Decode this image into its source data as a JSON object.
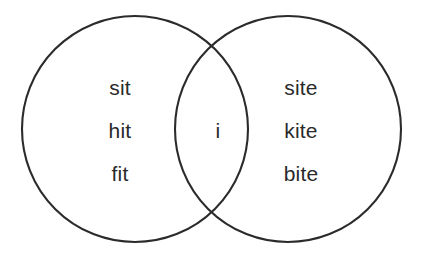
{
  "diagram": {
    "type": "venn-2-set",
    "title": "",
    "background_color": "#ffffff",
    "stroke_color": "#2b2b2b",
    "text_color": "#2a2a2a",
    "left_circle": {
      "center_x": 135,
      "center_y": 129,
      "radius": 113
    },
    "right_circle": {
      "center_x": 288,
      "center_y": 129,
      "radius": 113
    },
    "regions": {
      "left_only": {
        "name": "left-only-region",
        "items": [
          "sit",
          "hit",
          "fit"
        ]
      },
      "intersection": {
        "name": "intersection-region",
        "items": [
          "i"
        ]
      },
      "right_only": {
        "name": "right-only-region",
        "items": [
          "site",
          "kite",
          "bite"
        ]
      }
    }
  }
}
